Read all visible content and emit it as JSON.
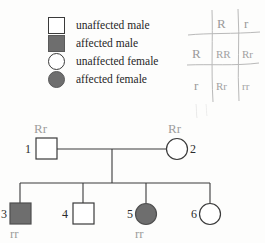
{
  "legend": {
    "items": [
      {
        "symbol": "square-open",
        "icon_name": "unaffected-male-icon",
        "label": "unaffected male"
      },
      {
        "symbol": "square-filled",
        "icon_name": "affected-male-icon",
        "label": "affected male"
      },
      {
        "symbol": "circle-open",
        "icon_name": "unaffected-female-icon",
        "label": "unaffected female"
      },
      {
        "symbol": "circle-filled",
        "icon_name": "affected-female-icon",
        "label": "affected female"
      }
    ]
  },
  "punnett": {
    "top_alleles": [
      "R",
      "r"
    ],
    "side_alleles": [
      "R",
      "r"
    ],
    "cells": [
      [
        "RR",
        "Rr"
      ],
      [
        "Rr",
        "rr"
      ]
    ]
  },
  "pedigree": {
    "generation_1": [
      {
        "id": "1",
        "number": "1",
        "sex": "male",
        "affected": false,
        "genotype": "Rr"
      },
      {
        "id": "2",
        "number": "2",
        "sex": "female",
        "affected": false,
        "genotype": "Rr"
      }
    ],
    "generation_2": [
      {
        "id": "3",
        "number": "3",
        "sex": "male",
        "affected": true,
        "genotype": "rr"
      },
      {
        "id": "4",
        "number": "4",
        "sex": "male",
        "affected": false,
        "genotype": ""
      },
      {
        "id": "5",
        "number": "5",
        "sex": "female",
        "affected": true,
        "genotype": "rr"
      },
      {
        "id": "6",
        "number": "6",
        "sex": "female",
        "affected": false,
        "genotype": ""
      }
    ]
  },
  "colors": {
    "affected_fill": "#6e6e6e",
    "unaffected_fill": "#ffffff",
    "stroke": "#3a3a3a",
    "handwriting": "#9a9a9a"
  }
}
